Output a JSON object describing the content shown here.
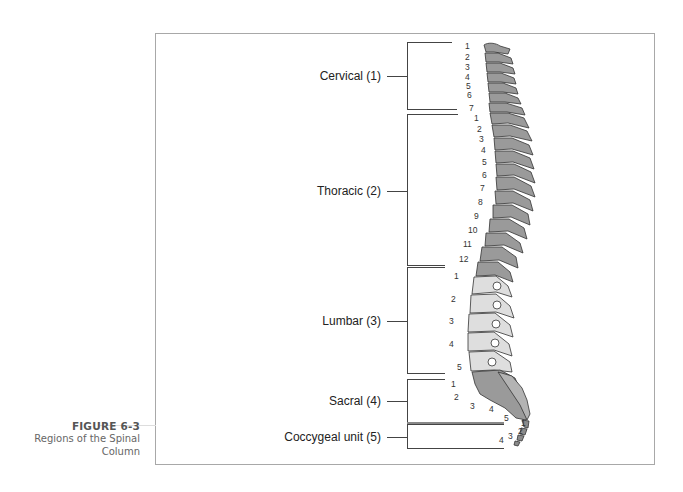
{
  "figure": {
    "number": "FIGURE 6-3",
    "title_line1": "Regions of the Spinal",
    "title_line2": "Column"
  },
  "regions": [
    {
      "label": "Cervical (1)",
      "count": 7,
      "numbers": [
        "1",
        "2",
        "3",
        "4",
        "5",
        "6",
        "7"
      ]
    },
    {
      "label": "Thoracic (2)",
      "count": 12,
      "numbers": [
        "1",
        "2",
        "3",
        "4",
        "5",
        "6",
        "7",
        "8",
        "9",
        "10",
        "11",
        "12"
      ]
    },
    {
      "label": "Lumbar (3)",
      "count": 5,
      "numbers": [
        "1",
        "2",
        "3",
        "4",
        "5"
      ]
    },
    {
      "label": "Sacral (4)",
      "count": 5,
      "numbers": [
        "1",
        "2",
        "3",
        "4",
        "5"
      ]
    },
    {
      "label": "Coccygeal unit (5)",
      "count": 4,
      "numbers": [
        "1",
        "2",
        "3",
        "4"
      ]
    }
  ],
  "colors": {
    "bone_dark": "#9a9a9a",
    "bone_light": "#dedede",
    "outline": "#333333",
    "frame": "#a8a8a8"
  }
}
